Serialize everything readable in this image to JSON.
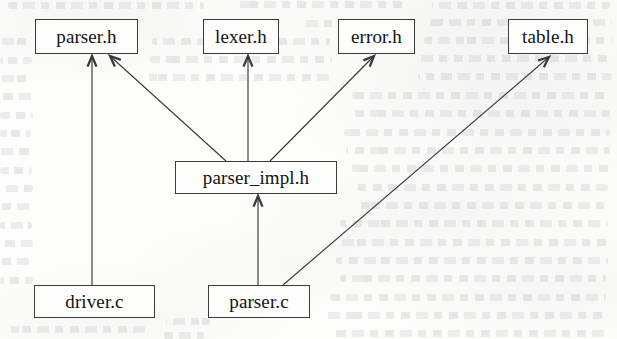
{
  "diagram": {
    "kind": "directed-graph",
    "background_color": "#fdfdfc",
    "line_color": "#3a3a3a",
    "text_color": "#131313",
    "nodes": [
      {
        "id": "parser_h",
        "label": "parser.h",
        "x": 35,
        "y": 19,
        "w": 103,
        "h": 35
      },
      {
        "id": "lexer_h",
        "label": "lexer.h",
        "x": 203,
        "y": 19,
        "w": 76,
        "h": 35
      },
      {
        "id": "error_h",
        "label": "error.h",
        "x": 338,
        "y": 19,
        "w": 77,
        "h": 35
      },
      {
        "id": "table_h",
        "label": "table.h",
        "x": 508,
        "y": 19,
        "w": 80,
        "h": 35
      },
      {
        "id": "parser_impl_h",
        "label": "parser_impl.h",
        "x": 175,
        "y": 161,
        "w": 162,
        "h": 33
      },
      {
        "id": "driver_c",
        "label": "driver.c",
        "x": 34,
        "y": 285,
        "w": 121,
        "h": 33
      },
      {
        "id": "parser_c",
        "label": "parser.c",
        "x": 208,
        "y": 285,
        "w": 102,
        "h": 33
      }
    ],
    "edges": [
      {
        "id": "driver_c-to-parser_h",
        "from": "driver.c",
        "to": "parser.h",
        "x1": 92,
        "y1": 285,
        "x2": 92,
        "y2": 56,
        "arrowhead": "open-chevron"
      },
      {
        "id": "parser_impl_h-to-parser_h",
        "from": "parser_impl.h",
        "to": "parser.h",
        "x1": 226,
        "y1": 161,
        "x2": 110,
        "y2": 56,
        "arrowhead": "open-chevron"
      },
      {
        "id": "parser_impl_h-to-lexer_h",
        "from": "parser_impl.h",
        "to": "lexer.h",
        "x1": 248,
        "y1": 161,
        "x2": 248,
        "y2": 56,
        "arrowhead": "open-chevron"
      },
      {
        "id": "parser_impl_h-to-error_h",
        "from": "parser_impl.h",
        "to": "error.h",
        "x1": 270,
        "y1": 161,
        "x2": 374,
        "y2": 56,
        "arrowhead": "open-chevron"
      },
      {
        "id": "parser_c-to-parser_impl_h",
        "from": "parser.c",
        "to": "parser_impl.h",
        "x1": 258,
        "y1": 285,
        "x2": 258,
        "y2": 196,
        "arrowhead": "open-chevron"
      },
      {
        "id": "parser_c-to-table_h",
        "from": "parser.c",
        "to": "table.h",
        "x1": 283,
        "y1": 285,
        "x2": 549,
        "y2": 57,
        "arrowhead": "open-chevron"
      }
    ],
    "ghost_lines": [
      {
        "x": 8,
        "y": 2,
        "w": 196
      },
      {
        "x": 236,
        "y": 1,
        "w": 168
      },
      {
        "x": 432,
        "y": 2,
        "w": 178
      },
      {
        "x": 300,
        "y": 20,
        "w": 96
      },
      {
        "x": 430,
        "y": 19,
        "w": 182
      },
      {
        "x": 0,
        "y": 38,
        "w": 30
      },
      {
        "x": 152,
        "y": 38,
        "w": 178
      },
      {
        "x": 424,
        "y": 37,
        "w": 188
      },
      {
        "x": 0,
        "y": 57,
        "w": 32
      },
      {
        "x": 150,
        "y": 56,
        "w": 182
      },
      {
        "x": 420,
        "y": 55,
        "w": 192
      },
      {
        "x": 0,
        "y": 75,
        "w": 30
      },
      {
        "x": 146,
        "y": 74,
        "w": 186
      },
      {
        "x": 418,
        "y": 73,
        "w": 194
      },
      {
        "x": 0,
        "y": 93,
        "w": 34
      },
      {
        "x": 352,
        "y": 92,
        "w": 258
      },
      {
        "x": 0,
        "y": 112,
        "w": 33
      },
      {
        "x": 348,
        "y": 110,
        "w": 262
      },
      {
        "x": 0,
        "y": 130,
        "w": 31
      },
      {
        "x": 344,
        "y": 129,
        "w": 266
      },
      {
        "x": 0,
        "y": 148,
        "w": 34
      },
      {
        "x": 346,
        "y": 147,
        "w": 264
      },
      {
        "x": 0,
        "y": 167,
        "w": 32
      },
      {
        "x": 348,
        "y": 165,
        "w": 262
      },
      {
        "x": 0,
        "y": 185,
        "w": 33
      },
      {
        "x": 352,
        "y": 184,
        "w": 256
      },
      {
        "x": 0,
        "y": 203,
        "w": 30
      },
      {
        "x": 356,
        "y": 202,
        "w": 250
      },
      {
        "x": 0,
        "y": 222,
        "w": 32
      },
      {
        "x": 340,
        "y": 220,
        "w": 268
      },
      {
        "x": 0,
        "y": 240,
        "w": 34
      },
      {
        "x": 338,
        "y": 239,
        "w": 270
      },
      {
        "x": 0,
        "y": 258,
        "w": 30
      },
      {
        "x": 336,
        "y": 257,
        "w": 272
      },
      {
        "x": 0,
        "y": 277,
        "w": 33
      },
      {
        "x": 340,
        "y": 275,
        "w": 266
      },
      {
        "x": 166,
        "y": 318,
        "w": 44
      },
      {
        "x": 330,
        "y": 294,
        "w": 276
      },
      {
        "x": 8,
        "y": 326,
        "w": 140
      },
      {
        "x": 326,
        "y": 312,
        "w": 280
      },
      {
        "x": 164,
        "y": 332,
        "w": 40
      },
      {
        "x": 332,
        "y": 330,
        "w": 274
      }
    ]
  }
}
